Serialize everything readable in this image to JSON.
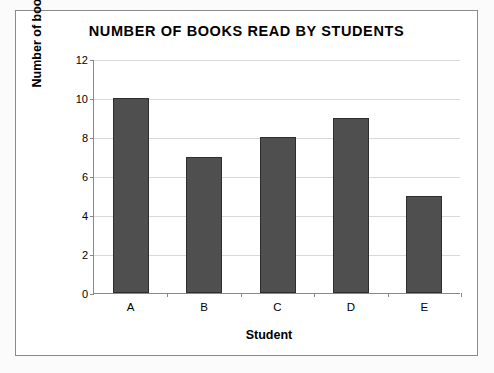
{
  "chart_data": {
    "type": "bar",
    "title": "NUMBER OF BOOKS READ BY STUDENTS",
    "xlabel": "Student",
    "ylabel": "Number of books",
    "categories": [
      "A",
      "B",
      "C",
      "D",
      "E"
    ],
    "values": [
      10,
      7,
      8,
      9,
      5
    ],
    "ylim": [
      0,
      12
    ],
    "ytick_labels": [
      "0",
      "2",
      "4",
      "6",
      "8",
      "10",
      "12"
    ],
    "ytick_values": [
      0,
      2,
      4,
      6,
      8,
      10,
      12
    ],
    "grid": true,
    "legend": false,
    "bar_color": "#4f4f4f",
    "bar_edge_color": "#2e2e2e",
    "gridline_color": "#d9d9d9",
    "axis_color": "#888888",
    "plot_background": "#ffffff",
    "frame_border_color": "#8a8a8a",
    "page_background": "#fbfbfb"
  }
}
